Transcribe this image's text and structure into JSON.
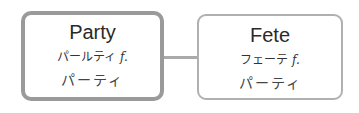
{
  "nodes": [
    {
      "title": "Party",
      "reading": "パールティ",
      "gender": "f.",
      "japanese": "パーティ",
      "highlighted": true
    },
    {
      "title": "Fete",
      "reading": "フェーテ",
      "gender": "f.",
      "japanese": "パーティ",
      "highlighted": false
    }
  ],
  "colors": {
    "border_highlight": "#9a9a9a",
    "border_normal": "#b0b0b0",
    "connector": "#aaaaaa"
  }
}
